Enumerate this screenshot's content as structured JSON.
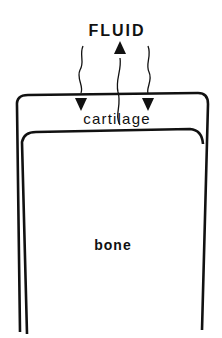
{
  "diagram": {
    "labels": {
      "fluid": "FLUID",
      "cartilage": "cartilage",
      "bone": "bone"
    },
    "arrows": [
      {
        "direction": "down",
        "from": "fluid",
        "to": "cartilage"
      },
      {
        "direction": "up",
        "from": "cartilage",
        "to": "fluid"
      },
      {
        "direction": "down",
        "from": "fluid",
        "to": "cartilage"
      }
    ],
    "stroke_color": "#111111"
  }
}
